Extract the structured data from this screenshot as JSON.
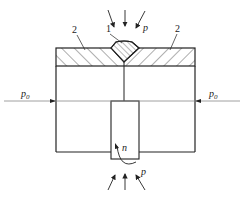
{
  "diagram": {
    "type": "weld-process-schematic",
    "labels": {
      "part_1": "1",
      "part_2_left": "2",
      "part_2_right": "2",
      "pressure_top": "p",
      "pressure_bottom": "p",
      "side_pressure_left": "p",
      "side_pressure_left_sub": "0",
      "side_pressure_right": "p",
      "side_pressure_right_sub": "0",
      "rotation": "n"
    },
    "components": [
      {
        "id": "1",
        "description": "weld bead (hatched V-shaped)"
      },
      {
        "id": "2",
        "description": "hatched plate / cladding layer"
      }
    ],
    "colors": {
      "line": "#222222",
      "background": "#ffffff"
    }
  }
}
